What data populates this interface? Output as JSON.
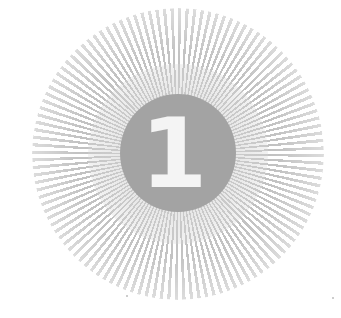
{
  "badge": {
    "number": "1",
    "colors": {
      "disc": "#a3a3a3",
      "numeral": "#f4f4f4",
      "rays": "#b9b9b9",
      "background": "#ffffff"
    }
  }
}
